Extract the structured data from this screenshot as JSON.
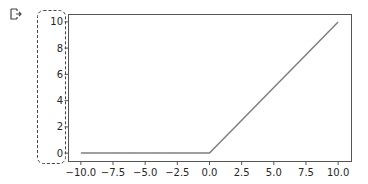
{
  "cell": {
    "output_icon": "output-redirect-icon",
    "selection_box": "dashed-rounded-selection"
  },
  "colors": {
    "line": "#7f7f7f",
    "axes": "#555555",
    "text": "#262626",
    "selection": "#444444"
  },
  "chart_data": {
    "type": "line",
    "title": "",
    "xlabel": "",
    "ylabel": "",
    "xlim": [
      -11,
      11
    ],
    "ylim": [
      -0.6,
      10.6
    ],
    "grid": false,
    "legend": null,
    "x_ticks": [
      -10.0,
      -7.5,
      -5.0,
      -2.5,
      0.0,
      2.5,
      5.0,
      7.5,
      10.0
    ],
    "x_tick_labels": [
      "−10.0",
      "−7.5",
      "−5.0",
      "−2.5",
      "0.0",
      "2.5",
      "5.0",
      "7.5",
      "10.0"
    ],
    "y_ticks": [
      0,
      2,
      4,
      6,
      8,
      10
    ],
    "y_tick_labels": [
      "0",
      "2",
      "4",
      "6",
      "8",
      "10"
    ],
    "series": [
      {
        "name": "relu",
        "x": [
          -10,
          -7.5,
          -5,
          -2.5,
          0,
          2.5,
          5,
          7.5,
          10
        ],
        "y": [
          0,
          0,
          0,
          0,
          0,
          2.5,
          5,
          7.5,
          10
        ]
      }
    ]
  }
}
